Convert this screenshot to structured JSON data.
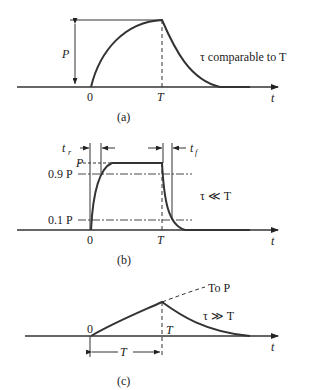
{
  "panels": [
    {
      "id": "a",
      "caption": "(a)",
      "annotation": "τ comparable to T",
      "labels": {
        "origin": "0",
        "end": "T",
        "axis": "t",
        "amplitude": "P"
      }
    },
    {
      "id": "b",
      "caption": "(b)",
      "annotation": "τ ≪ T",
      "labels": {
        "origin": "0",
        "end": "T",
        "axis": "t",
        "p": "P",
        "p90": "0.9 P",
        "p10": "0.1 P",
        "rise": "t",
        "rise_sub": "r",
        "fall": "t",
        "fall_sub": "f"
      }
    },
    {
      "id": "c",
      "caption": "(c)",
      "annotation": "τ ≫ T",
      "labels": {
        "origin": "0",
        "end": "T",
        "axis": "t",
        "asymptote": "To P",
        "duration": "T"
      }
    }
  ],
  "colors": {
    "curve": "#333333",
    "line": "#333333",
    "background": "#ffffff"
  }
}
